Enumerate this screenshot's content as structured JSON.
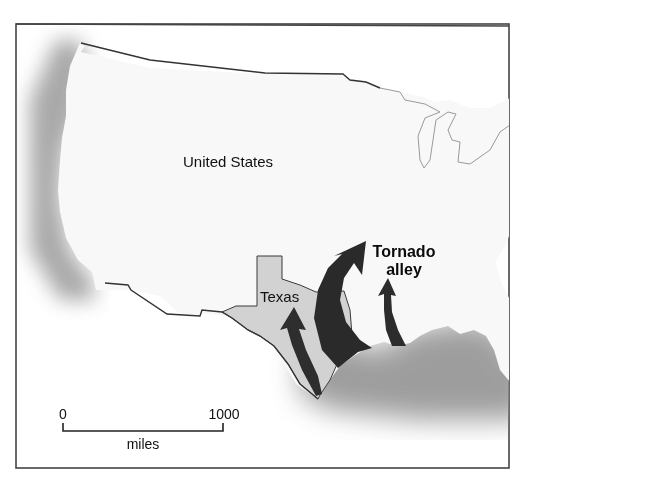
{
  "map": {
    "country_label": "United States",
    "state_label": "Texas",
    "region_label_line1": "Tornado",
    "region_label_line2": "alley",
    "highlighted_state": "Texas",
    "arrows": [
      {
        "name": "tornado-arrow-texas",
        "direction": "northward"
      },
      {
        "name": "tornado-arrow-large",
        "direction": "northeastward"
      },
      {
        "name": "tornado-arrow-east",
        "direction": "northward"
      }
    ]
  },
  "scale_bar": {
    "start_label": "0",
    "end_label": "1000",
    "unit_label": "miles"
  },
  "colors": {
    "land": "#fafafa",
    "texas_fill": "#d2d2d2",
    "arrow_fill": "#2b2b2b",
    "coast_shadow": "#8c8c8c",
    "border_line": "#333333",
    "frame": "#444444"
  }
}
